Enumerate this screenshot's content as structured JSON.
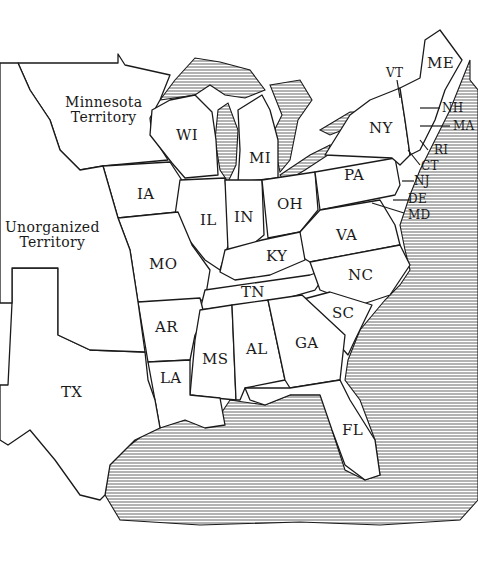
{
  "map": {
    "title": "Eastern United States, c. 1850",
    "regions": [
      {
        "id": "minnesota-territory",
        "label": "Minnesota\nTerritory"
      },
      {
        "id": "unorganized-territory",
        "label": "Unorganized\nTerritory"
      },
      {
        "id": "wi",
        "label": "WI"
      },
      {
        "id": "mi",
        "label": "MI"
      },
      {
        "id": "ia",
        "label": "IA"
      },
      {
        "id": "il",
        "label": "IL"
      },
      {
        "id": "in",
        "label": "IN"
      },
      {
        "id": "oh",
        "label": "OH"
      },
      {
        "id": "pa",
        "label": "PA"
      },
      {
        "id": "ny",
        "label": "NY"
      },
      {
        "id": "vt",
        "label": "VT"
      },
      {
        "id": "me",
        "label": "ME"
      },
      {
        "id": "nh",
        "label": "NH"
      },
      {
        "id": "ma",
        "label": "MA"
      },
      {
        "id": "ri",
        "label": "RI"
      },
      {
        "id": "ct",
        "label": "CT"
      },
      {
        "id": "nj",
        "label": "NJ"
      },
      {
        "id": "de",
        "label": "DE"
      },
      {
        "id": "md",
        "label": "MD"
      },
      {
        "id": "va",
        "label": "VA"
      },
      {
        "id": "ky",
        "label": "KY"
      },
      {
        "id": "mo",
        "label": "MO"
      },
      {
        "id": "nc",
        "label": "NC"
      },
      {
        "id": "tn",
        "label": "TN"
      },
      {
        "id": "ar",
        "label": "AR"
      },
      {
        "id": "sc",
        "label": "SC"
      },
      {
        "id": "ms",
        "label": "MS"
      },
      {
        "id": "al",
        "label": "AL"
      },
      {
        "id": "ga",
        "label": "GA"
      },
      {
        "id": "la",
        "label": "LA"
      },
      {
        "id": "tx",
        "label": "TX"
      },
      {
        "id": "fl",
        "label": "FL"
      }
    ]
  }
}
